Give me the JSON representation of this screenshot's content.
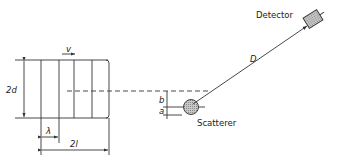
{
  "diagram": {
    "labels": {
      "velocity": "v",
      "height": "2d",
      "wavelength": "λ",
      "length": "2l",
      "offset_b": "b",
      "offset_a": "a",
      "distance": "D",
      "scatterer": "Scatterer",
      "detector": "Detector"
    },
    "colors": {
      "line": "#333333",
      "scatterer_fill": "#bdbdbd",
      "background": "#ffffff"
    }
  }
}
